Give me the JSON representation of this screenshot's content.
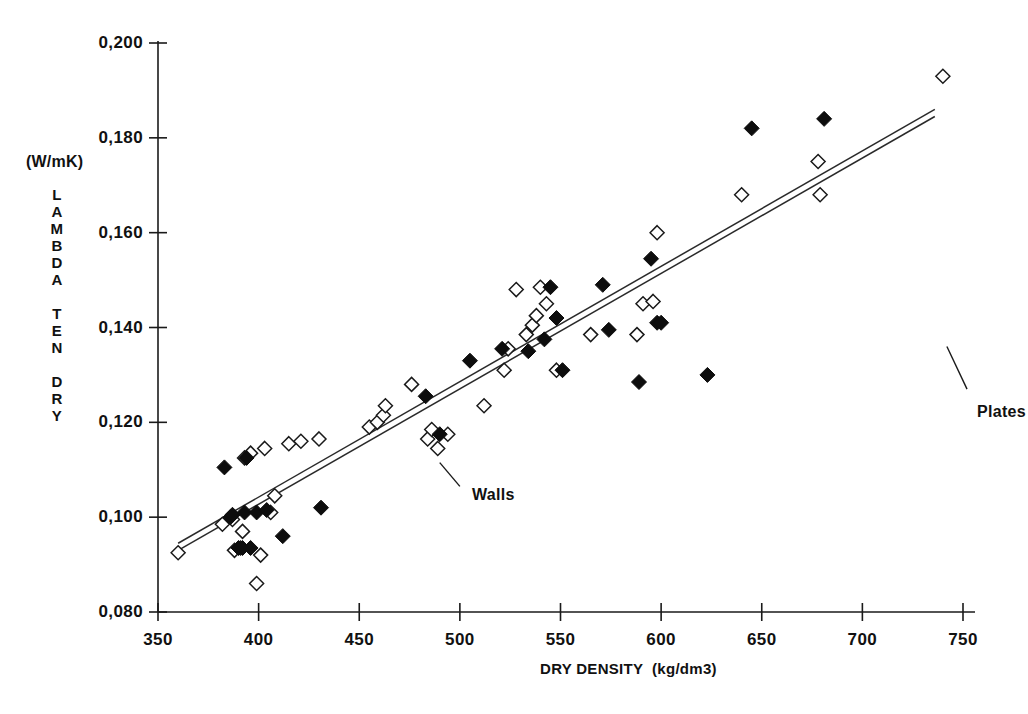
{
  "chart_data": {
    "type": "scatter",
    "title": "",
    "xlabel": "DRY DENSITY  (kg/dm3)",
    "ylabel_stacked": [
      "L",
      "A",
      "M",
      "B",
      "D",
      "A",
      "",
      "T",
      "E",
      "N",
      "",
      "D",
      "R",
      "Y"
    ],
    "ylabel_plain": "LAMBDA TEN DRY",
    "yunit": "(W/mK)",
    "xlim": [
      350,
      750
    ],
    "ylim": [
      0.08,
      0.2
    ],
    "xticks": [
      350,
      400,
      450,
      500,
      550,
      600,
      650,
      700,
      750
    ],
    "xtick_labels": [
      "350",
      "400",
      "450",
      "500",
      "550",
      "600",
      "650",
      "700",
      "750"
    ],
    "yticks": [
      0.08,
      0.1,
      0.12,
      0.14,
      0.16,
      0.18,
      0.2
    ],
    "ytick_labels": [
      "0,080",
      "0,100",
      "0,120",
      "0,140",
      "0,160",
      "0,180",
      "0,200"
    ],
    "grid": false,
    "legend_position": "inline-annotations",
    "decimal_separator": ",",
    "series": [
      {
        "name": "Walls",
        "marker": "open-diamond",
        "color": "#ffffff",
        "edge_color": "#1a1a1a",
        "points": [
          [
            360,
            0.0925
          ],
          [
            382,
            0.0985
          ],
          [
            387,
            0.0995
          ],
          [
            388,
            0.093
          ],
          [
            391,
            0.0935
          ],
          [
            392,
            0.097
          ],
          [
            393,
            0.1125
          ],
          [
            396,
            0.1135
          ],
          [
            399,
            0.086
          ],
          [
            401,
            0.092
          ],
          [
            403,
            0.1145
          ],
          [
            406,
            0.101
          ],
          [
            408,
            0.1045
          ],
          [
            415,
            0.1155
          ],
          [
            421,
            0.116
          ],
          [
            430,
            0.1165
          ],
          [
            455,
            0.119
          ],
          [
            459,
            0.12
          ],
          [
            462,
            0.1215
          ],
          [
            463,
            0.1235
          ],
          [
            476,
            0.128
          ],
          [
            484,
            0.1165
          ],
          [
            486,
            0.1185
          ],
          [
            489,
            0.1145
          ],
          [
            494,
            0.1175
          ],
          [
            512,
            0.1235
          ],
          [
            522,
            0.131
          ],
          [
            524,
            0.1355
          ],
          [
            528,
            0.148
          ],
          [
            533,
            0.1385
          ],
          [
            536,
            0.1405
          ],
          [
            538,
            0.1425
          ],
          [
            540,
            0.1485
          ],
          [
            543,
            0.145
          ],
          [
            548,
            0.131
          ],
          [
            565,
            0.1385
          ],
          [
            588,
            0.1385
          ],
          [
            591,
            0.145
          ],
          [
            596,
            0.1455
          ],
          [
            598,
            0.16
          ],
          [
            640,
            0.168
          ],
          [
            678,
            0.175
          ],
          [
            679,
            0.168
          ],
          [
            740,
            0.193
          ]
        ]
      },
      {
        "name": "Plates",
        "marker": "filled-diamond",
        "color": "#0d0d0d",
        "edge_color": "#0d0d0d",
        "points": [
          [
            383,
            0.1105
          ],
          [
            386,
            0.1
          ],
          [
            387,
            0.1005
          ],
          [
            390,
            0.0935
          ],
          [
            392,
            0.0935
          ],
          [
            393,
            0.101
          ],
          [
            394,
            0.1125
          ],
          [
            396,
            0.0935
          ],
          [
            399,
            0.101
          ],
          [
            404,
            0.1015
          ],
          [
            412,
            0.096
          ],
          [
            431,
            0.102
          ],
          [
            483,
            0.1255
          ],
          [
            490,
            0.1175
          ],
          [
            505,
            0.133
          ],
          [
            521,
            0.1355
          ],
          [
            534,
            0.135
          ],
          [
            542,
            0.1375
          ],
          [
            545,
            0.1485
          ],
          [
            548,
            0.142
          ],
          [
            551,
            0.131
          ],
          [
            571,
            0.149
          ],
          [
            574,
            0.1395
          ],
          [
            589,
            0.1285
          ],
          [
            595,
            0.1545
          ],
          [
            598,
            0.141
          ],
          [
            600,
            0.141
          ],
          [
            623,
            0.13
          ],
          [
            645,
            0.182
          ],
          [
            681,
            0.184
          ]
        ]
      }
    ],
    "fit_lines": [
      {
        "name": "upper-fit",
        "x0": 360,
        "y0": 0.0945,
        "x1": 736,
        "y1": 0.186
      },
      {
        "name": "lower-fit",
        "x0": 360,
        "y0": 0.093,
        "x1": 736,
        "y1": 0.1845
      }
    ],
    "annotations": [
      {
        "label": "Walls",
        "text_x": 506,
        "text_y": 0.1045,
        "leader_from_x": 490,
        "leader_from_y": 0.1115,
        "leader_to_x": 500,
        "leader_to_y": 0.1065
      },
      {
        "label": "Plates",
        "text_x": 757,
        "text_y": 0.122,
        "leader_from_x": 742,
        "leader_from_y": 0.136,
        "leader_to_x": 752,
        "leader_to_y": 0.127
      }
    ]
  }
}
